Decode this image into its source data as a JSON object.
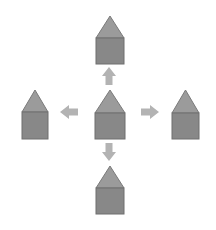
{
  "diagram": {
    "canvas": {
      "width": 216,
      "height": 230,
      "background": "#ffffff"
    },
    "palette": {
      "roof_fill": "#9b9b9b",
      "roof_stroke": "#7a7a7a",
      "body_fill": "#888888",
      "body_stroke": "#6f6f6f",
      "arrow_fill": "#b3b3b3",
      "arrow_stroke": "#b3b3b3"
    },
    "shapes": [
      {
        "id": "house-top",
        "label": "Top house shape",
        "position": "top",
        "icon": "house-pentagon-icon",
        "x": 96,
        "y": 16,
        "width": 28,
        "height": 48,
        "roof_height": 22,
        "roof_fill": "#9b9b9b",
        "body_fill": "#888888"
      },
      {
        "id": "house-left",
        "label": "Left house shape",
        "position": "left",
        "icon": "house-pentagon-icon",
        "x": 22,
        "y": 90,
        "width": 26,
        "height": 49,
        "roof_height": 22,
        "roof_fill": "#9b9b9b",
        "body_fill": "#888888"
      },
      {
        "id": "house-center",
        "label": "Center house shape",
        "position": "center",
        "icon": "house-pentagon-icon",
        "x": 95,
        "y": 90,
        "width": 30,
        "height": 49,
        "roof_height": 23,
        "roof_fill": "#9b9b9b",
        "body_fill": "#888888"
      },
      {
        "id": "house-right",
        "label": "Right house shape",
        "position": "right",
        "icon": "house-pentagon-icon",
        "x": 172,
        "y": 90,
        "width": 27,
        "height": 49,
        "roof_height": 23,
        "roof_fill": "#9b9b9b",
        "body_fill": "#888888"
      },
      {
        "id": "house-bottom",
        "label": "Bottom house shape",
        "position": "bottom",
        "icon": "house-pentagon-icon",
        "x": 96,
        "y": 166,
        "width": 28,
        "height": 48,
        "roof_height": 22,
        "roof_fill": "#9b9b9b",
        "body_fill": "#888888"
      }
    ],
    "arrows": [
      {
        "id": "arrow-up",
        "label": "Arrow pointing up",
        "icon": "arrow-up-icon",
        "direction": "up",
        "from": "house-center",
        "to": "house-top",
        "cx": 109,
        "cy": 76,
        "length": 18,
        "thickness": 14,
        "fill": "#b3b3b3"
      },
      {
        "id": "arrow-left",
        "label": "Arrow pointing left",
        "icon": "arrow-left-icon",
        "direction": "left",
        "from": "house-center",
        "to": "house-left",
        "cx": 69,
        "cy": 112,
        "length": 18,
        "thickness": 14,
        "fill": "#b3b3b3"
      },
      {
        "id": "arrow-right",
        "label": "Arrow pointing right",
        "icon": "arrow-right-icon",
        "direction": "right",
        "from": "house-center",
        "to": "house-right",
        "cx": 150,
        "cy": 112,
        "length": 18,
        "thickness": 14,
        "fill": "#b3b3b3"
      },
      {
        "id": "arrow-down",
        "label": "Arrow pointing down",
        "icon": "arrow-down-icon",
        "direction": "down",
        "from": "house-center",
        "to": "house-bottom",
        "cx": 109,
        "cy": 152,
        "length": 18,
        "thickness": 14,
        "fill": "#b3b3b3"
      }
    ]
  }
}
